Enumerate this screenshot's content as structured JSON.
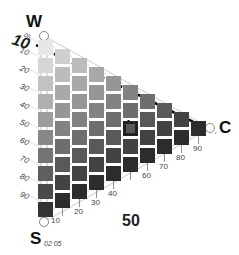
{
  "diagram": {
    "axes": {
      "whiteness": {
        "name": "W"
      },
      "blackness": {
        "name": "S"
      },
      "chromaticness": {
        "name": "C"
      }
    },
    "blackness_ticks": [
      "05",
      "10",
      "20",
      "30",
      "40",
      "50",
      "60",
      "70",
      "80",
      "90"
    ],
    "chromaticness_ticks": [
      "10",
      "20",
      "30",
      "40",
      "50",
      "60",
      "70",
      "80",
      "90"
    ],
    "small_s_ticks": "02 05",
    "highlight_label_whiteness": "10",
    "highlight_label_chromaticness": "50",
    "highlight_cell": {
      "chromaticness": 50,
      "blackness": 20
    },
    "colors": {
      "line": "#999999",
      "dashed": "#000000",
      "highlight_border": "#222222"
    }
  }
}
